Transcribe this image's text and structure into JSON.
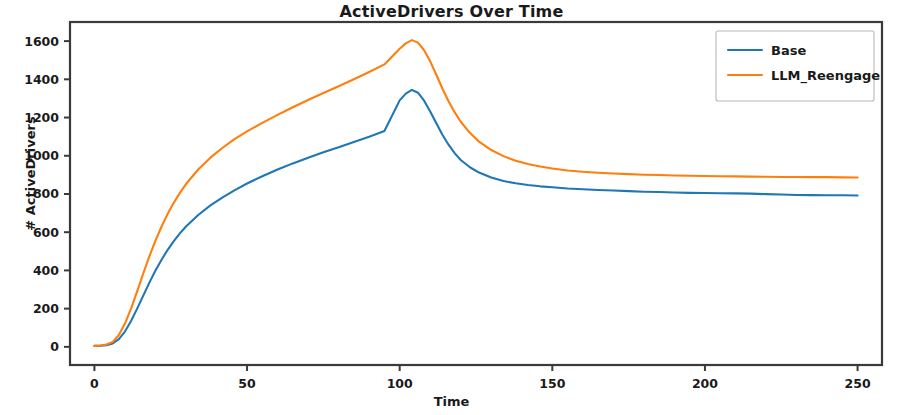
{
  "chart_data": {
    "type": "line",
    "title": "ActiveDrivers Over Time",
    "xlabel": "Time",
    "ylabel": "# ActiveDrivers",
    "xlim": [
      -8,
      258
    ],
    "ylim": [
      -95,
      1700
    ],
    "xticks": [
      0,
      50,
      100,
      150,
      200,
      250
    ],
    "xtick_labels": [
      "0",
      "50",
      "100",
      "150",
      "200",
      "250"
    ],
    "yticks": [
      0,
      200,
      400,
      600,
      800,
      1000,
      1200,
      1400,
      1600
    ],
    "ytick_labels": [
      "0",
      "200",
      "400",
      "600",
      "800",
      "1000",
      "1200",
      "1400",
      "1600"
    ],
    "grid": false,
    "legend_position": "upper right",
    "x": [
      0,
      2,
      4,
      6,
      8,
      10,
      12,
      14,
      16,
      18,
      20,
      22,
      24,
      26,
      28,
      30,
      34,
      38,
      42,
      46,
      50,
      55,
      60,
      65,
      70,
      75,
      80,
      85,
      90,
      95,
      100,
      102,
      104,
      106,
      108,
      110,
      112,
      114,
      116,
      118,
      120,
      123,
      126,
      130,
      134,
      138,
      142,
      146,
      150,
      155,
      160,
      165,
      170,
      175,
      180,
      185,
      190,
      195,
      200,
      205,
      210,
      215,
      220,
      225,
      230,
      235,
      240,
      245,
      250
    ],
    "series": [
      {
        "name": "Base",
        "color": "#1f77b4",
        "values": [
          5,
          6,
          9,
          18,
          40,
          80,
          135,
          200,
          268,
          336,
          400,
          456,
          508,
          553,
          594,
          630,
          690,
          740,
          782,
          820,
          855,
          893,
          928,
          960,
          990,
          1018,
          1045,
          1072,
          1100,
          1130,
          1290,
          1325,
          1345,
          1330,
          1288,
          1232,
          1170,
          1110,
          1058,
          1014,
          978,
          940,
          912,
          886,
          868,
          856,
          847,
          840,
          835,
          829,
          825,
          821,
          818,
          815,
          812,
          810,
          808,
          806,
          805,
          804,
          803,
          802,
          799,
          797,
          795,
          794,
          793,
          793,
          792
        ]
      },
      {
        "name": "LLM_Reengage",
        "color": "#ff7f0e",
        "values": [
          5,
          7,
          12,
          26,
          62,
          122,
          200,
          290,
          384,
          474,
          556,
          630,
          696,
          754,
          806,
          852,
          928,
          990,
          1042,
          1088,
          1128,
          1172,
          1214,
          1254,
          1292,
          1328,
          1364,
          1400,
          1438,
          1478,
          1560,
          1588,
          1605,
          1592,
          1552,
          1494,
          1424,
          1352,
          1285,
          1228,
          1178,
          1120,
          1074,
          1030,
          998,
          974,
          957,
          944,
          933,
          923,
          916,
          911,
          907,
          904,
          901,
          899,
          897,
          895,
          894,
          893,
          892,
          891,
          890,
          889,
          889,
          888,
          888,
          887,
          886
        ]
      }
    ]
  },
  "legend": {
    "entries": [
      {
        "label": "Base",
        "color": "#1f77b4"
      },
      {
        "label": "LLM_Reengage",
        "color": "#ff7f0e"
      }
    ]
  }
}
